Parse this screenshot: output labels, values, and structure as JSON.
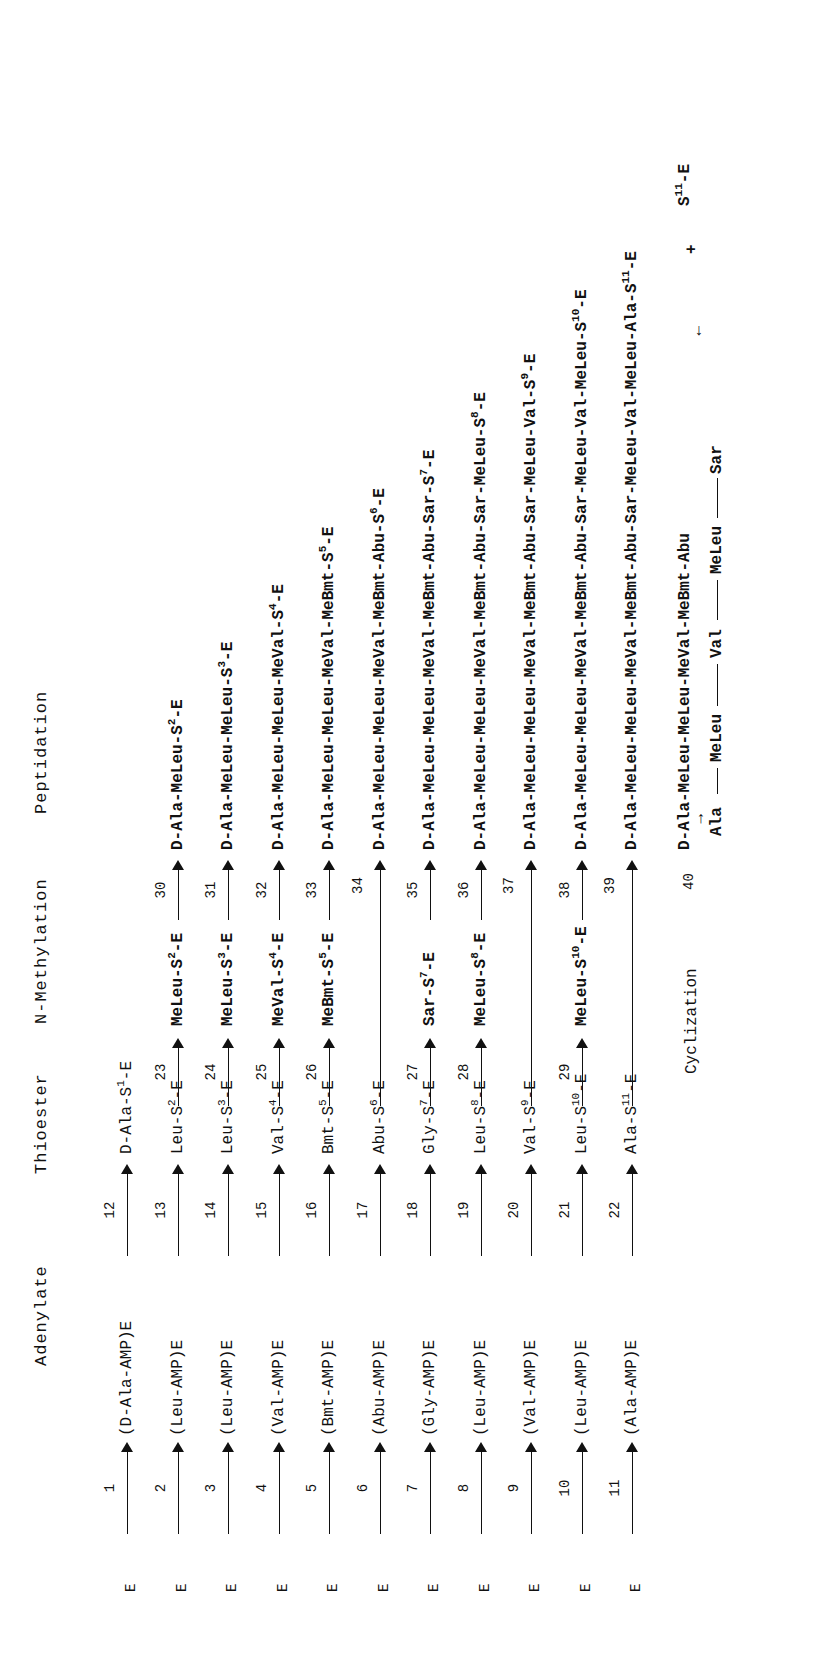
{
  "orientation": "rotated-90-ccw",
  "headers": {
    "adenylate": "Adenylate",
    "thioester": "Thioester",
    "n_methylation": "N-Methylation",
    "peptidation": "Peptidation"
  },
  "rows": [
    {
      "e": "E",
      "step_a": "1",
      "adenylate": "(D-Ala-AMP)E",
      "step_t": "12",
      "thio_pre": "D-Ala-S",
      "thio_sup": "1",
      "thio_post": "-E",
      "step_m": "",
      "meth_pre": "",
      "meth_sup": "",
      "meth_post": "",
      "step_p": "",
      "pep_pre": "",
      "pep_sup": "",
      "pep_post": ""
    },
    {
      "e": "E",
      "step_a": "2",
      "adenylate": "(Leu-AMP)E",
      "step_t": "13",
      "thio_pre": "Leu-S",
      "thio_sup": "2",
      "thio_post": "-E",
      "step_m": "23",
      "meth_pre": "MeLeu-S",
      "meth_sup": "2",
      "meth_post": "-E",
      "step_p": "30",
      "pep_pre": "D-Ala-MeLeu-S",
      "pep_sup": "2",
      "pep_post": "-E"
    },
    {
      "e": "E",
      "step_a": "3",
      "adenylate": "(Leu-AMP)E",
      "step_t": "14",
      "thio_pre": "Leu-S",
      "thio_sup": "3",
      "thio_post": "-E",
      "step_m": "24",
      "meth_pre": "MeLeu-S",
      "meth_sup": "3",
      "meth_post": "-E",
      "step_p": "31",
      "pep_pre": "D-Ala-MeLeu-MeLeu-S",
      "pep_sup": "3",
      "pep_post": "-E"
    },
    {
      "e": "E",
      "step_a": "4",
      "adenylate": "(Val-AMP)E",
      "step_t": "15",
      "thio_pre": "Val-S",
      "thio_sup": "4",
      "thio_post": "-E",
      "step_m": "25",
      "meth_pre": "MeVal-S",
      "meth_sup": "4",
      "meth_post": "-E",
      "step_p": "32",
      "pep_pre": "D-Ala-MeLeu-MeLeu-MeVal-S",
      "pep_sup": "4",
      "pep_post": "-E"
    },
    {
      "e": "E",
      "step_a": "5",
      "adenylate": "(Bmt-AMP)E",
      "step_t": "16",
      "thio_pre": "Bmt-S",
      "thio_sup": "5",
      "thio_post": "-E",
      "step_m": "26",
      "meth_pre": "MeBmt-S",
      "meth_sup": "5",
      "meth_post": "-E",
      "step_p": "33",
      "pep_pre": "D-Ala-MeLeu-MeLeu-MeVal-MeBmt-S",
      "pep_sup": "5",
      "pep_post": "-E"
    },
    {
      "e": "E",
      "step_a": "6",
      "adenylate": "(Abu-AMP)E",
      "step_t": "17",
      "thio_pre": "Abu-S",
      "thio_sup": "6",
      "thio_post": "-E",
      "step_m": "",
      "meth_pre": "",
      "meth_sup": "",
      "meth_post": "",
      "step_p": "34",
      "pep_pre": "D-Ala-MeLeu-MeLeu-MeVal-MeBmt-Abu-S",
      "pep_sup": "6",
      "pep_post": "-E"
    },
    {
      "e": "E",
      "step_a": "7",
      "adenylate": "(Gly-AMP)E",
      "step_t": "18",
      "thio_pre": "Gly-S",
      "thio_sup": "7",
      "thio_post": "-E",
      "step_m": "27",
      "meth_pre": "Sar-S",
      "meth_sup": "7",
      "meth_post": "-E",
      "step_p": "35",
      "pep_pre": "D-Ala-MeLeu-MeLeu-MeVal-MeBmt-Abu-Sar-S",
      "pep_sup": "7",
      "pep_post": "-E"
    },
    {
      "e": "E",
      "step_a": "8",
      "adenylate": "(Leu-AMP)E",
      "step_t": "19",
      "thio_pre": "Leu-S",
      "thio_sup": "8",
      "thio_post": "-E",
      "step_m": "28",
      "meth_pre": "MeLeu-S",
      "meth_sup": "8",
      "meth_post": "-E",
      "step_p": "36",
      "pep_pre": "D-Ala-MeLeu-MeLeu-MeVal-MeBmt-Abu-Sar-MeLeu-S",
      "pep_sup": "8",
      "pep_post": "-E"
    },
    {
      "e": "E",
      "step_a": "9",
      "adenylate": "(Val-AMP)E",
      "step_t": "20",
      "thio_pre": "Val-S",
      "thio_sup": "9",
      "thio_post": "-E",
      "step_m": "",
      "meth_pre": "",
      "meth_sup": "",
      "meth_post": "",
      "step_p": "37",
      "pep_pre": "D-Ala-MeLeu-MeLeu-MeVal-MeBmt-Abu-Sar-MeLeu-Val-S",
      "pep_sup": "9",
      "pep_post": "-E"
    },
    {
      "e": "E",
      "step_a": "10",
      "adenylate": "(Leu-AMP)E",
      "step_t": "21",
      "thio_pre": "Leu-S",
      "thio_sup": "10",
      "thio_post": "-E",
      "step_m": "29",
      "meth_pre": "MeLeu-S",
      "meth_sup": "10",
      "meth_post": "-E",
      "step_p": "38",
      "pep_pre": "D-Ala-MeLeu-MeLeu-MeVal-MeBmt-Abu-Sar-MeLeu-Val-MeLeu-S",
      "pep_sup": "10",
      "pep_post": "-E"
    },
    {
      "e": "E",
      "step_a": "11",
      "adenylate": "(Ala-AMP)E",
      "step_t": "22",
      "thio_pre": "Ala-S",
      "thio_sup": "11",
      "thio_post": "-E",
      "step_m": "",
      "meth_pre": "",
      "meth_sup": "",
      "meth_post": "",
      "step_p": "39",
      "pep_pre": "D-Ala-MeLeu-MeLeu-MeVal-MeBmt-Abu-Sar-MeLeu-Val-MeLeu-Ala-S",
      "pep_sup": "11",
      "pep_post": "-E"
    }
  ],
  "cyclization": {
    "label": "Cyclization",
    "step": "40",
    "top_chain": "D-Ala-MeLeu-MeLeu-MeVal-MeBmt-Abu",
    "bottom_ala": "Ala",
    "bottom_meleu1": "MeLeu",
    "bottom_val": "Val",
    "bottom_meleu2": "MeLeu",
    "bottom_sar": "Sar",
    "plus": "+",
    "released_pre": "S",
    "released_sup": "11",
    "released_post": "-E",
    "up_arrow": "↑",
    "down_arrow": "↓"
  }
}
